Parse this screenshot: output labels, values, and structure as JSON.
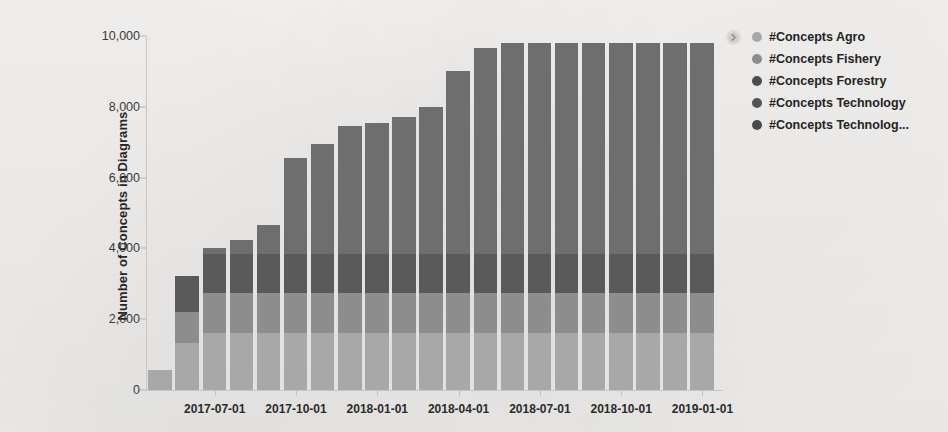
{
  "chart_data": {
    "type": "bar",
    "stacked": true,
    "title": "",
    "xlabel": "",
    "ylabel": "Number of Concepts in Diagrams",
    "ylim": [
      0,
      10000
    ],
    "ytick_labels": [
      "0",
      "2,000",
      "4,000",
      "6,000",
      "8,000",
      "10,000"
    ],
    "ytick_values": [
      0,
      2000,
      4000,
      6000,
      8000,
      10000
    ],
    "grid": false,
    "legend_position": "right",
    "categories": [
      "2017-05-01",
      "2017-06-01",
      "2017-07-01",
      "2017-08-01",
      "2017-09-01",
      "2017-10-01",
      "2017-11-01",
      "2017-12-01",
      "2018-01-01",
      "2018-02-01",
      "2018-03-01",
      "2018-04-01",
      "2018-05-01",
      "2018-06-01",
      "2018-07-01",
      "2018-08-01",
      "2018-09-01",
      "2018-10-01",
      "2018-11-01",
      "2018-12-01",
      "2019-01-01"
    ],
    "xtick_labels": [
      "2017-07-01",
      "2017-10-01",
      "2018-01-01",
      "2018-04-01",
      "2018-07-01",
      "2018-10-01",
      "2019-01-01"
    ],
    "xtick_indices": [
      2,
      5,
      8,
      11,
      14,
      17,
      20
    ],
    "series": [
      {
        "name": "#Concepts Agro",
        "color": "#a8a8a8",
        "values": [
          570,
          1320,
          1600,
          1600,
          1600,
          1600,
          1600,
          1600,
          1600,
          1600,
          1600,
          1600,
          1600,
          1600,
          1600,
          1600,
          1600,
          1600,
          1600,
          1600,
          1600
        ]
      },
      {
        "name": "#Concepts Fishery",
        "color": "#8d8d8d",
        "values": [
          0,
          880,
          1150,
          1150,
          1150,
          1150,
          1150,
          1150,
          1150,
          1150,
          1150,
          1150,
          1150,
          1150,
          1150,
          1150,
          1150,
          1150,
          1150,
          1150,
          1150
        ]
      },
      {
        "name": "#Concepts Forestry",
        "color": "#5a5a5a",
        "values": [
          0,
          1020,
          1100,
          1100,
          1100,
          1100,
          1100,
          1100,
          1100,
          1100,
          1100,
          1100,
          1100,
          1100,
          1100,
          1100,
          1100,
          1100,
          1100,
          1100,
          1100
        ]
      },
      {
        "name": "#Concepts Technology",
        "color": "#6e6e6e",
        "values": [
          0,
          0,
          150,
          400,
          820,
          2700,
          3100,
          3600,
          3700,
          3850,
          4150,
          5150,
          5800,
          5950,
          5950,
          5950,
          5950,
          5950,
          5950,
          5950,
          5950
        ]
      },
      {
        "name": "#Concepts Technolog...",
        "color": "#636363",
        "values": [
          0,
          0,
          0,
          0,
          0,
          0,
          0,
          0,
          0,
          0,
          0,
          0,
          0,
          0,
          0,
          0,
          0,
          0,
          0,
          0,
          0
        ]
      }
    ],
    "totals": [
      570,
      3220,
      4000,
      4250,
      4670,
      6550,
      6950,
      7450,
      7550,
      7700,
      8000,
      9000,
      9650,
      9800,
      9800,
      9800,
      9800,
      9800,
      9800,
      9800,
      9800
    ]
  },
  "legend": {
    "expand_icon": "chevron-right-circle-icon",
    "items": [
      {
        "label": "#Concepts Agro",
        "color": "#a8a8a8"
      },
      {
        "label": "#Concepts Fishery",
        "color": "#8d8d8d"
      },
      {
        "label": "#Concepts Forestry",
        "color": "#4d4d4d"
      },
      {
        "label": "#Concepts Technology",
        "color": "#555555"
      },
      {
        "label": "#Concepts Technolog...",
        "color": "#4a4a4a"
      }
    ]
  },
  "theme": {
    "background": "#f4f3f1",
    "axis_color": "#c9c7c4",
    "text_color": "#252525"
  }
}
